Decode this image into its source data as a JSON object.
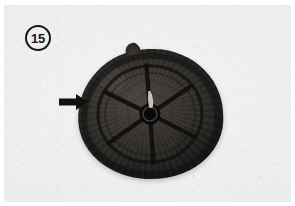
{
  "figure": {
    "number_label": "15",
    "badge_icon": "circled-number-badge",
    "plate_width": 295,
    "plate_height": 206
  },
  "annotation": {
    "arrow": {
      "icon": "right-arrow-icon",
      "direction": "right",
      "color": "#111111",
      "points_at": "hat-left-rim"
    }
  },
  "subject": {
    "name": "cap-with-internal-spoke-frame",
    "view": "top-down",
    "body_color": "#33302c",
    "frame_color": "#121110",
    "parts": [
      {
        "name": "hat-top-tab",
        "label": "top tab"
      },
      {
        "name": "hat-brim",
        "label": "brim band"
      },
      {
        "name": "hat-frame-rim",
        "label": "inner circular rim"
      },
      {
        "name": "hat-frame-spokes",
        "label": "radial spokes"
      },
      {
        "name": "hat-frame-hub",
        "label": "central hub grommet"
      },
      {
        "name": "hat-hub-highlight",
        "label": "hub highlight"
      }
    ],
    "spoke_count": 6
  },
  "colors": {
    "paper": "#ececec",
    "page": "#ffffff",
    "ink": "#15171a",
    "arrow": "#111111"
  }
}
